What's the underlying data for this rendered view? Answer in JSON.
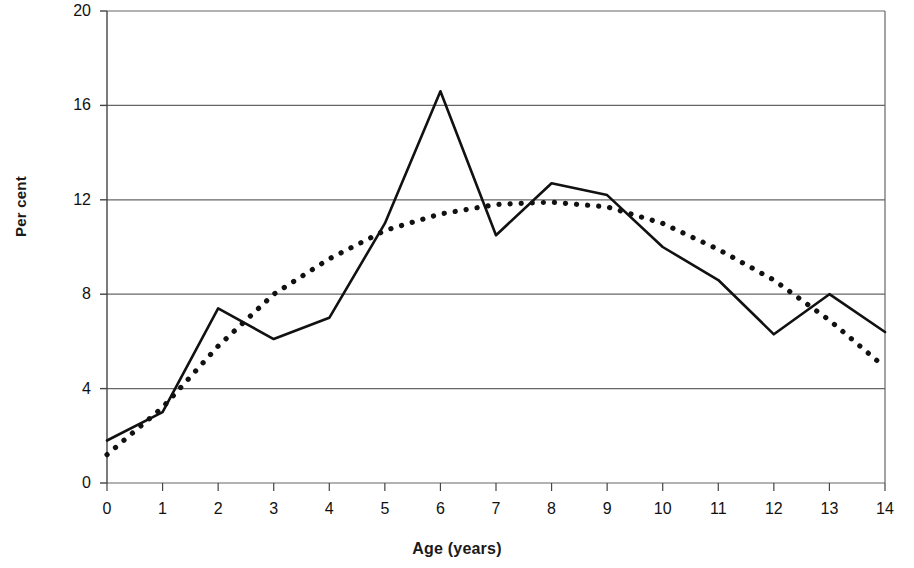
{
  "chart_data": {
    "type": "line",
    "title": "",
    "subtitle": "",
    "xlabel": "Age (years)",
    "ylabel": "Per cent",
    "x": [
      0,
      1,
      2,
      3,
      4,
      5,
      6,
      7,
      8,
      9,
      10,
      11,
      12,
      13,
      14
    ],
    "xlim": [
      0,
      14
    ],
    "ylim": [
      0,
      20
    ],
    "xticks": [
      "0",
      "1",
      "2",
      "3",
      "4",
      "5",
      "6",
      "7",
      "8",
      "9",
      "10",
      "11",
      "12",
      "13",
      "14"
    ],
    "yticks": [
      "0",
      "4",
      "8",
      "12",
      "16",
      "20"
    ],
    "ytick_values": [
      0,
      4,
      8,
      12,
      16,
      20
    ],
    "grid": "horizontal",
    "legend": "none",
    "series": [
      {
        "name": "Observed",
        "style": "solid",
        "color": "#111111",
        "values": [
          1.8,
          3.0,
          7.4,
          6.1,
          7.0,
          11.0,
          16.6,
          10.5,
          12.7,
          12.2,
          10.0,
          8.6,
          6.3,
          8.0,
          6.4
        ]
      },
      {
        "name": "Trend",
        "style": "dotted",
        "color": "#111111",
        "values": [
          1.2,
          3.2,
          5.8,
          8.0,
          9.5,
          10.7,
          11.4,
          11.8,
          11.9,
          11.7,
          11.0,
          9.9,
          8.6,
          6.9,
          4.9
        ]
      }
    ]
  },
  "axes": {
    "y_title": "Per cent",
    "x_title": "Age (years)"
  }
}
